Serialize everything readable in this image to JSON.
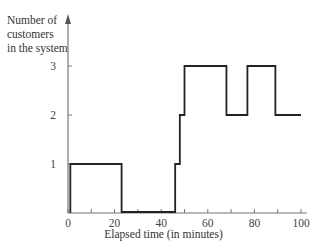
{
  "chart_data": {
    "type": "line",
    "step": true,
    "title": "",
    "xlabel": "Elapsed time (in minutes)",
    "ylabel": "Number of customers in the system",
    "ylabel_lines": [
      "Number of",
      "customers",
      "in the system"
    ],
    "xlim": [
      0,
      100
    ],
    "ylim": [
      0,
      3.3
    ],
    "x_ticks": [
      0,
      20,
      40,
      60,
      80,
      100
    ],
    "x_minor_ticks": [
      10,
      30,
      50,
      70,
      90
    ],
    "y_ticks": [
      1,
      2,
      3
    ],
    "grid": false,
    "legend": null,
    "series": [
      {
        "name": "Number of customers",
        "x": [
          0,
          1,
          23,
          46,
          48,
          50,
          68,
          77,
          89,
          100
        ],
        "values": [
          0,
          1,
          0,
          1,
          2,
          3,
          2,
          3,
          2,
          2
        ]
      }
    ]
  }
}
